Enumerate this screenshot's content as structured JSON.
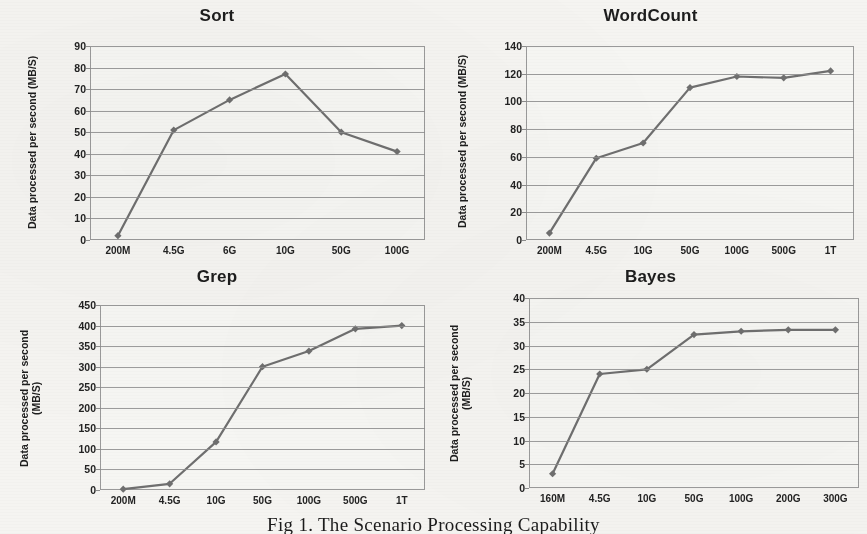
{
  "figure": {
    "caption": "Fig 1. The Scenario Processing Capability",
    "series_color": "#6f6f6f",
    "grid_color": "#8d8d8d",
    "axis_color": "#9a9a9a",
    "background": "#f5f4f1"
  },
  "chart_data": [
    {
      "type": "line",
      "title": "Sort",
      "xlabel": "",
      "ylabel": "Data processed per second (MB/S)",
      "ylabel_lines": "Data processed per second (MB/S)",
      "categories": [
        "200M",
        "4.5G",
        "6G",
        "10G",
        "50G",
        "100G"
      ],
      "values": [
        2,
        51,
        65,
        77,
        50,
        41
      ],
      "ylim": [
        0,
        90
      ],
      "ytick_step": 10,
      "yticks": [
        0,
        10,
        20,
        30,
        40,
        50,
        60,
        70,
        80,
        90
      ],
      "grid": true,
      "legend": "none",
      "marker": "diamond"
    },
    {
      "type": "line",
      "title": "WordCount",
      "xlabel": "",
      "ylabel": "Data processed per second (MB/S)",
      "ylabel_lines": "Data processed per second (MB/S)",
      "categories": [
        "200M",
        "4.5G",
        "10G",
        "50G",
        "100G",
        "500G",
        "1T"
      ],
      "values": [
        5,
        59,
        70,
        110,
        118,
        117,
        122
      ],
      "ylim": [
        0,
        140
      ],
      "ytick_step": 20,
      "yticks": [
        0,
        20,
        40,
        60,
        80,
        100,
        120,
        140
      ],
      "grid": true,
      "legend": "none",
      "marker": "diamond"
    },
    {
      "type": "line",
      "title": "Grep",
      "xlabel": "",
      "ylabel": "Data processed per second (MB/S)",
      "ylabel_lines": "Data processed per second\n(MB/S)",
      "categories": [
        "200M",
        "4.5G",
        "10G",
        "50G",
        "100G",
        "500G",
        "1T"
      ],
      "values": [
        2,
        15,
        117,
        300,
        338,
        392,
        400
      ],
      "ylim": [
        0,
        450
      ],
      "ytick_step": 50,
      "yticks": [
        0,
        50,
        100,
        150,
        200,
        250,
        300,
        350,
        400,
        450
      ],
      "grid": true,
      "legend": "none",
      "marker": "diamond"
    },
    {
      "type": "line",
      "title": "Bayes",
      "xlabel": "",
      "ylabel": "Data processed per second (MB/S)",
      "ylabel_lines": "Data processed per second\n(MB/S)",
      "categories": [
        "160M",
        "4.5G",
        "10G",
        "50G",
        "100G",
        "200G",
        "300G"
      ],
      "values": [
        3,
        24,
        25,
        32.3,
        33,
        33.3,
        33.3
      ],
      "ylim": [
        0,
        40
      ],
      "ytick_step": 5,
      "yticks": [
        0,
        5,
        10,
        15,
        20,
        25,
        30,
        35,
        40
      ],
      "grid": true,
      "legend": "none",
      "marker": "diamond"
    }
  ]
}
